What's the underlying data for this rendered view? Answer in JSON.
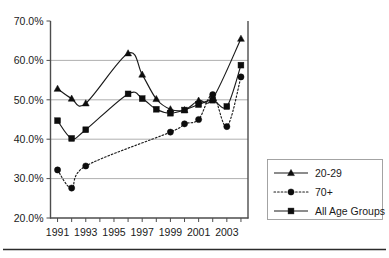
{
  "chart_data": {
    "type": "line",
    "title": "",
    "subtitle": "",
    "xlabel": "",
    "ylabel": "",
    "x": [
      1991,
      1992,
      1993,
      1994,
      1995,
      1996,
      1997,
      1998,
      1999,
      2000,
      2001,
      2002,
      2003,
      2004
    ],
    "xlim": [
      1990.5,
      2004.5
    ],
    "ylim": [
      20.0,
      70.0
    ],
    "y_tick_labels": [
      "20.0%",
      "30.0%",
      "40.0%",
      "50.0%",
      "60.0%",
      "70.0%"
    ],
    "y_tick_values": [
      20.0,
      30.0,
      40.0,
      50.0,
      60.0,
      70.0
    ],
    "x_tick_labels": [
      "1991",
      "1993",
      "1995",
      "1997",
      "1999",
      "2001",
      "2003"
    ],
    "x_tick_values": [
      1991,
      1993,
      1995,
      1997,
      1999,
      2001,
      2003
    ],
    "grid": "horizontal",
    "legend_position": "right",
    "series": [
      {
        "name": "20-29",
        "marker": "triangle",
        "linestyle": "solid",
        "color": "#1a1a1a",
        "x": [
          1991,
          1992,
          1993,
          1996,
          1997,
          1998,
          1999,
          2000,
          2001,
          2002,
          2004
        ],
        "values": [
          52.8,
          50.3,
          49.1,
          61.8,
          56.4,
          50.2,
          47.6,
          47.4,
          49.8,
          50.3,
          65.5
        ]
      },
      {
        "name": "70+",
        "marker": "circle",
        "linestyle": "dotted",
        "color": "#1a1a1a",
        "x": [
          1991,
          1992,
          1993,
          1999,
          2000,
          2001,
          2002,
          2003,
          2004
        ],
        "values": [
          32.2,
          27.6,
          33.2,
          41.8,
          43.9,
          45.0,
          51.3,
          43.2,
          55.8
        ]
      },
      {
        "name": "All Age Groups",
        "marker": "square",
        "linestyle": "solid",
        "color": "#1a1a1a",
        "x": [
          1991,
          1992,
          1993,
          1996,
          1997,
          1998,
          1999,
          2000,
          2001,
          2002,
          2003,
          2004
        ],
        "values": [
          44.7,
          40.2,
          42.4,
          51.5,
          50.3,
          47.6,
          46.6,
          47.4,
          48.8,
          49.9,
          48.3,
          58.8
        ]
      }
    ],
    "legend_entries": [
      {
        "label": "20-29",
        "marker": "triangle",
        "linestyle": "solid"
      },
      {
        "label": "70+",
        "marker": "circle",
        "linestyle": "dotted"
      },
      {
        "label": "All Age Groups",
        "marker": "square",
        "linestyle": "solid"
      }
    ]
  }
}
